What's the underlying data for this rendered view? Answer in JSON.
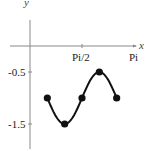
{
  "chart_data": {
    "type": "line",
    "title": "",
    "xlabel": "x",
    "ylabel": "y",
    "function": "y = -1 + 0.5*cos(3x)",
    "x_ticks": [
      {
        "value": 1.5708,
        "label": "Pi/2"
      },
      {
        "value": 3.1416,
        "label": "Pi"
      }
    ],
    "y_ticks": [
      {
        "value": -0.5,
        "label": "-0.5"
      },
      {
        "value": -1.5,
        "label": "-1.5"
      }
    ],
    "xlim": [
      -0.6,
      3.2
    ],
    "ylim": [
      -1.95,
      0.5
    ],
    "grid": false,
    "legend": null,
    "series": [
      {
        "name": "curve",
        "x_start": 0.5236,
        "x_end": 2.618,
        "color": "#111111"
      }
    ],
    "points": [
      {
        "x": 0.5236,
        "x_label": "Pi/6",
        "y": -1.0
      },
      {
        "x": 1.0472,
        "x_label": "Pi/3",
        "y": -1.5
      },
      {
        "x": 1.5708,
        "x_label": "Pi/2",
        "y": -1.0
      },
      {
        "x": 2.0944,
        "x_label": "2Pi/3",
        "y": -0.5
      },
      {
        "x": 2.618,
        "x_label": "5Pi/6",
        "y": -1.0
      }
    ]
  },
  "axes": {
    "x_label": "x",
    "y_label": "y",
    "x_tick_labels": [
      "Pi/2",
      "Pi"
    ],
    "y_tick_labels": [
      "-0.5",
      "-1.5"
    ]
  },
  "colors": {
    "axis": "#888888",
    "curve": "#111111",
    "points": "#111111",
    "background": "#ffffff"
  }
}
